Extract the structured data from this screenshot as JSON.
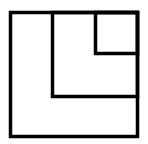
{
  "diagram": {
    "type": "nested-squares",
    "stroke_color": "#000000",
    "background_color": "#ffffff",
    "stroke_width": 3.5,
    "outer_square": {
      "x": 10.5,
      "y": 12.5,
      "w": 127,
      "h": 124
    },
    "middle_region": {
      "x": 52.5,
      "y": 12.5,
      "w": 85,
      "h": 84
    },
    "inner_square": {
      "x": 95.5,
      "y": 12.5,
      "w": 42,
      "h": 41
    }
  }
}
